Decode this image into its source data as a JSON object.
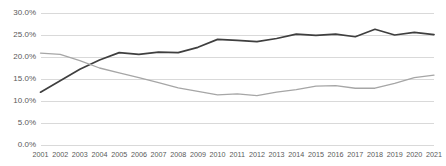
{
  "chart_data": {
    "type": "line",
    "title": "",
    "subtitle": "",
    "xlabel": "",
    "ylabel": "",
    "grid": true,
    "legend_position": "none",
    "x": [
      2001,
      2002,
      2003,
      2004,
      2005,
      2006,
      2007,
      2008,
      2009,
      2010,
      2011,
      2012,
      2013,
      2014,
      2015,
      2016,
      2017,
      2018,
      2019,
      2020,
      2021
    ],
    "categories": [
      "2001",
      "2002",
      "2003",
      "2004",
      "2005",
      "2006",
      "2007",
      "2008",
      "2009",
      "2010",
      "2011",
      "2012",
      "2013",
      "2014",
      "2015",
      "2016",
      "2017",
      "2018",
      "2019",
      "2020",
      "2021"
    ],
    "ylim": [
      0.0,
      30.0
    ],
    "yticks": [
      0.0,
      5.0,
      10.0,
      15.0,
      20.0,
      25.0,
      30.0
    ],
    "ytick_labels": [
      "0.0%",
      "5.0%",
      "10.0%",
      "15.0%",
      "20.0%",
      "25.0%",
      "30.0%"
    ],
    "xtick_labels": [
      "2001",
      "2002",
      "2003",
      "2004",
      "2005",
      "2006",
      "2007",
      "2008",
      "2009",
      "2010",
      "2011",
      "2012",
      "2013",
      "2014",
      "2015",
      "2016",
      "2017",
      "2018",
      "2019",
      "2020",
      "2021"
    ],
    "series": [
      {
        "name": "Series 1",
        "color": "#3f3f3f",
        "values": [
          12.0,
          14.6,
          17.2,
          19.3,
          21.0,
          20.6,
          21.1,
          21.0,
          22.2,
          24.0,
          23.8,
          23.5,
          24.2,
          25.2,
          24.9,
          25.2,
          24.6,
          26.3,
          25.0,
          25.6,
          25.1
        ]
      },
      {
        "name": "Series 2",
        "color": "#a6a6a6",
        "values": [
          20.9,
          20.6,
          19.2,
          17.5,
          16.4,
          15.3,
          14.2,
          13.0,
          12.2,
          11.4,
          11.6,
          11.2,
          12.0,
          12.6,
          13.4,
          13.5,
          12.9,
          12.9,
          14.0,
          15.3,
          15.9
        ]
      }
    ]
  },
  "axis": {
    "y_labels": [
      "30.0%",
      "25.0%",
      "20.0%",
      "15.0%",
      "10.0%",
      "5.0%",
      "0.0%"
    ],
    "x_labels": [
      "2001",
      "2002",
      "2003",
      "2004",
      "2005",
      "2006",
      "2007",
      "2008",
      "2009",
      "2010",
      "2011",
      "2012",
      "2013",
      "2014",
      "2015",
      "2016",
      "2017",
      "2018",
      "2019",
      "2020",
      "2021"
    ]
  },
  "style": {
    "gridline_color": "#d9d9d9",
    "axis_text_color": "#595959",
    "background": "#ffffff"
  }
}
